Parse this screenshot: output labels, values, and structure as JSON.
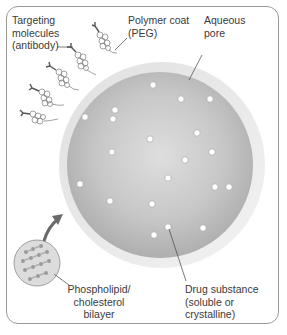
{
  "labels": {
    "targeting": [
      "Targeting",
      "molecules",
      "(antibody)"
    ],
    "polymer": [
      "Polymer coat",
      "(PEG)"
    ],
    "aqueous": [
      "Aqueous",
      "pore"
    ],
    "bilayer": [
      "Phospholipid/",
      "cholesterol",
      "bilayer"
    ],
    "drug": [
      "Drug substance",
      "(soluble or crystalline)"
    ]
  },
  "colors": {
    "frame": "#9a9a9a",
    "coat_ring": "#e6e6e6",
    "core": "#b4b4b4",
    "core_highlight": "#dcdcdc",
    "particle": "#ffffff",
    "text": "#3a3a3a",
    "arrow": "#6a6a6a"
  },
  "particles": [
    [
      153,
      85
    ],
    [
      181,
      99
    ],
    [
      210,
      99
    ],
    [
      85,
      117
    ],
    [
      115,
      110
    ],
    [
      113,
      118
    ],
    [
      197,
      133
    ],
    [
      150,
      139
    ],
    [
      212,
      152
    ],
    [
      112,
      152
    ],
    [
      185,
      160
    ],
    [
      168,
      178
    ],
    [
      80,
      184
    ],
    [
      215,
      187
    ],
    [
      229,
      187
    ],
    [
      110,
      201
    ],
    [
      152,
      204
    ],
    [
      168,
      227
    ],
    [
      152,
      233
    ],
    [
      203,
      228
    ]
  ]
}
